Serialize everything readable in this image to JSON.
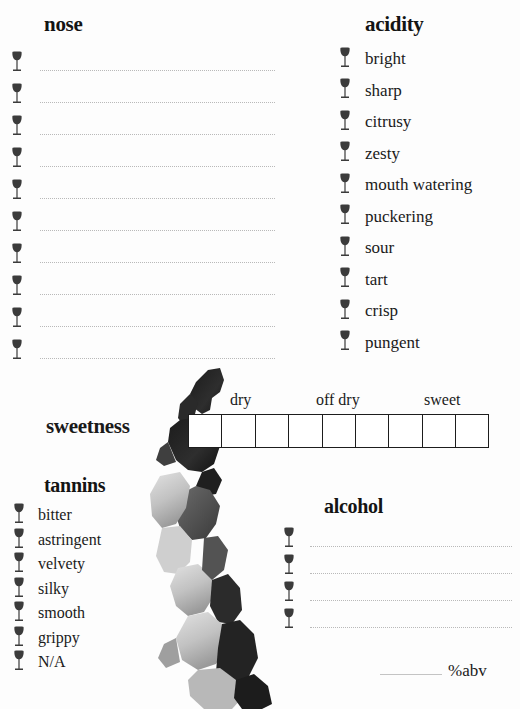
{
  "page": {
    "ink_color": "#1a1a1a",
    "rule_color": "#b9b9b9",
    "box_border_color": "#1d1d1d",
    "background": "#fdfdfd"
  },
  "nose": {
    "heading": "nose",
    "glass_icon": "wine-glass-icon",
    "line_count": 10,
    "lines": [
      "",
      "",
      "",
      "",
      "",
      "",
      "",
      "",
      "",
      ""
    ]
  },
  "acidity": {
    "heading": "acidity",
    "glass_icon": "wine-glass-icon",
    "options": [
      "bright",
      "sharp",
      "citrusy",
      "zesty",
      "mouth watering",
      "puckering",
      "sour",
      "tart",
      "crisp",
      "pungent"
    ]
  },
  "sweetness": {
    "label": "sweetness",
    "cell_count": 9,
    "cells": [
      "",
      "",
      "",
      "",
      "",
      "",
      "",
      "",
      ""
    ],
    "ticks": [
      {
        "label": "dry",
        "left": 42
      },
      {
        "label": "off dry",
        "left": 132
      },
      {
        "label": "sweet",
        "left": 238
      }
    ]
  },
  "tannins": {
    "heading": "tannins",
    "glass_icon": "wine-glass-icon",
    "options": [
      "bitter",
      "astringent",
      "velvety",
      "silky",
      "smooth",
      "grippy",
      "N/A"
    ]
  },
  "alcohol": {
    "heading": "alcohol",
    "glass_icon": "wine-glass-icon",
    "line_count": 4,
    "lines": [
      "",
      "",
      "",
      ""
    ],
    "abv_value": "",
    "abv_unit": "%abv"
  },
  "decoration": {
    "splash": "watercolor-splash"
  }
}
